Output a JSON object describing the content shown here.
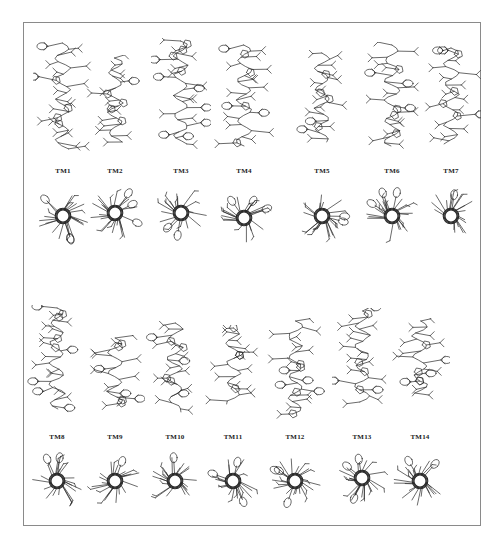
{
  "figure": {
    "row_1": {
      "helices": [
        {
          "id": "TM1",
          "label": "TM1",
          "cx": 63,
          "side_top": 40,
          "side_bottom": 155,
          "label_y": 171,
          "top_cy": 216
        },
        {
          "id": "TM2",
          "label": "TM2",
          "cx": 115,
          "side_top": 55,
          "side_bottom": 148,
          "label_y": 171,
          "top_cy": 213
        },
        {
          "id": "TM3",
          "label": "TM3",
          "cx": 181,
          "side_top": 38,
          "side_bottom": 150,
          "label_y": 171,
          "top_cy": 213
        },
        {
          "id": "TM4",
          "label": "TM4",
          "cx": 244,
          "side_top": 42,
          "side_bottom": 152,
          "label_y": 171,
          "top_cy": 218
        },
        {
          "id": "TM5",
          "label": "TM5",
          "cx": 322,
          "side_top": 50,
          "side_bottom": 148,
          "label_y": 171,
          "top_cy": 216
        },
        {
          "id": "TM6",
          "label": "TM6",
          "cx": 392,
          "side_top": 42,
          "side_bottom": 152,
          "label_y": 171,
          "top_cy": 216
        },
        {
          "id": "TM7",
          "label": "TM7",
          "cx": 451,
          "side_top": 45,
          "side_bottom": 150,
          "label_y": 171,
          "top_cy": 216
        }
      ]
    },
    "row_2": {
      "helices": [
        {
          "id": "TM8",
          "label": "TM8",
          "cx": 57,
          "side_top": 305,
          "side_bottom": 415,
          "label_y": 437,
          "top_cy": 481
        },
        {
          "id": "TM9",
          "label": "TM9",
          "cx": 115,
          "side_top": 335,
          "side_bottom": 412,
          "label_y": 437,
          "top_cy": 481
        },
        {
          "id": "TM10",
          "label": "TM10",
          "cx": 175,
          "side_top": 320,
          "side_bottom": 418,
          "label_y": 437,
          "top_cy": 481
        },
        {
          "id": "TM11",
          "label": "TM11",
          "cx": 233,
          "side_top": 325,
          "side_bottom": 410,
          "label_y": 437,
          "top_cy": 481
        },
        {
          "id": "TM12",
          "label": "TM12",
          "cx": 295,
          "side_top": 318,
          "side_bottom": 420,
          "label_y": 437,
          "top_cy": 481
        },
        {
          "id": "TM13",
          "label": "TM13",
          "cx": 362,
          "side_top": 308,
          "side_bottom": 408,
          "label_y": 437,
          "top_cy": 478
        },
        {
          "id": "TM14",
          "label": "TM14",
          "cx": 420,
          "side_top": 318,
          "side_bottom": 402,
          "label_y": 437,
          "top_cy": 481
        }
      ]
    },
    "colors": {
      "ink": "#2a2a2a",
      "frame": "#8a8a8a",
      "label": "#222222"
    }
  }
}
